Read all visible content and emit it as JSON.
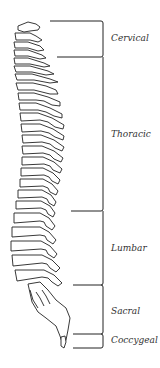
{
  "diagram": {
    "regions": [
      {
        "name": "Cervical",
        "top": 21,
        "bottom": 57,
        "bracket_start_x": 50,
        "label_y": 34
      },
      {
        "name": "Thoracic",
        "top": 57,
        "bottom": 211,
        "bracket_start_x": 57,
        "label_y": 130
      },
      {
        "name": "Lumbar",
        "top": 211,
        "bottom": 285,
        "bracket_start_x": 71,
        "label_y": 244
      },
      {
        "name": "Sacral",
        "top": 285,
        "bottom": 334,
        "bracket_start_x": 73,
        "label_y": 307
      },
      {
        "name": "Coccygeal",
        "top": 334,
        "bottom": 348,
        "bracket_start_x": 73,
        "label_y": 336
      }
    ],
    "colors": {
      "line": "#222222",
      "text": "#333333",
      "background": "#ffffff"
    }
  }
}
